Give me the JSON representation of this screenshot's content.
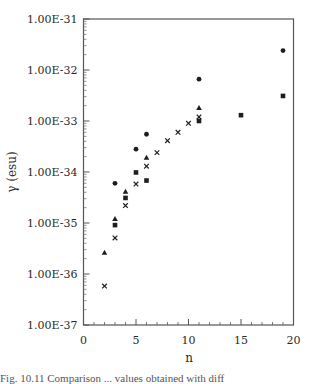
{
  "chart_data": {
    "type": "scatter",
    "title": "",
    "xlabel": "n",
    "ylabel": "γ (esu)",
    "xlim": [
      0,
      20
    ],
    "ylim": [
      1e-37,
      1e-31
    ],
    "yscale": "log",
    "grid": false,
    "legend": null,
    "x_ticks": [
      "0",
      "5",
      "10",
      "15",
      "20"
    ],
    "y_ticks": [
      "1.00E-31",
      "1.00E-32",
      "1.00E-33",
      "1.00E-34",
      "1.00E-35",
      "1.00E-36",
      "1.00E-37"
    ],
    "series": [
      {
        "name": "circle",
        "marker": "circle",
        "x": [
          3,
          5,
          6,
          11,
          19
        ],
        "y": [
          6e-35,
          2.8e-34,
          5.5e-34,
          6.6e-33,
          2.4e-32
        ]
      },
      {
        "name": "triangle",
        "marker": "triangle",
        "x": [
          2,
          3,
          4,
          6,
          11
        ],
        "y": [
          2.6e-36,
          1.2e-35,
          4.1e-35,
          1.9e-34,
          1.8e-33
        ]
      },
      {
        "name": "square",
        "marker": "square",
        "x": [
          3,
          4,
          5,
          6,
          11,
          15,
          19
        ],
        "y": [
          9.1e-36,
          3.1e-35,
          9.8e-35,
          6.8e-35,
          1e-33,
          1.3e-33,
          3.1e-33
        ]
      },
      {
        "name": "cross",
        "marker": "cross",
        "x": [
          2,
          3,
          4,
          5,
          6,
          7,
          8,
          9,
          10,
          11
        ],
        "y": [
          5.8e-37,
          5.1e-36,
          2.2e-35,
          5.8e-35,
          1.3e-34,
          2.4e-34,
          4.1e-34,
          6e-34,
          9e-34,
          1.2e-33
        ]
      }
    ]
  },
  "caption": "Fig. 10.11   Comparison ... values obtained with diff"
}
